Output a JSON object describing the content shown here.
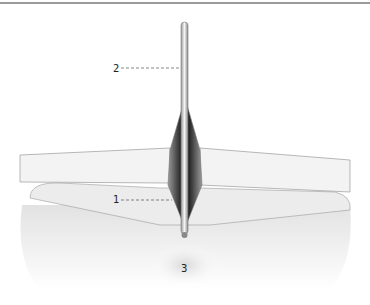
{
  "figure": {
    "labels": [
      {
        "id": "1",
        "text": "1",
        "target": "incision-tissue-edge"
      },
      {
        "id": "2",
        "text": "2",
        "target": "probe-instrument"
      },
      {
        "id": "3",
        "text": "3",
        "target": "anatomical-region-below"
      }
    ],
    "colors": {
      "top_rule": "#9a9a9a",
      "outline": "#8a8a8a",
      "cavity_dark": "#2a2a2a",
      "tissue_light": "#eeeeee",
      "leader_line": "#555555"
    }
  }
}
